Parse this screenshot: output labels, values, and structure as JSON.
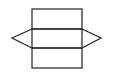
{
  "diagram": {
    "stroke_color": "#222222",
    "background": "#ffffff",
    "shapes": {
      "rect_top": {
        "x": 32,
        "y": 9,
        "w": 50,
        "h": 20
      },
      "rect_middle": {
        "x": 32,
        "y": 29,
        "w": 50,
        "h": 19
      },
      "rect_bottom": {
        "x": 32,
        "y": 48,
        "w": 50,
        "h": 20
      },
      "triangle_left": "32,29 12,38 32,48",
      "triangle_right": "82,29 101,38 82,48"
    }
  }
}
